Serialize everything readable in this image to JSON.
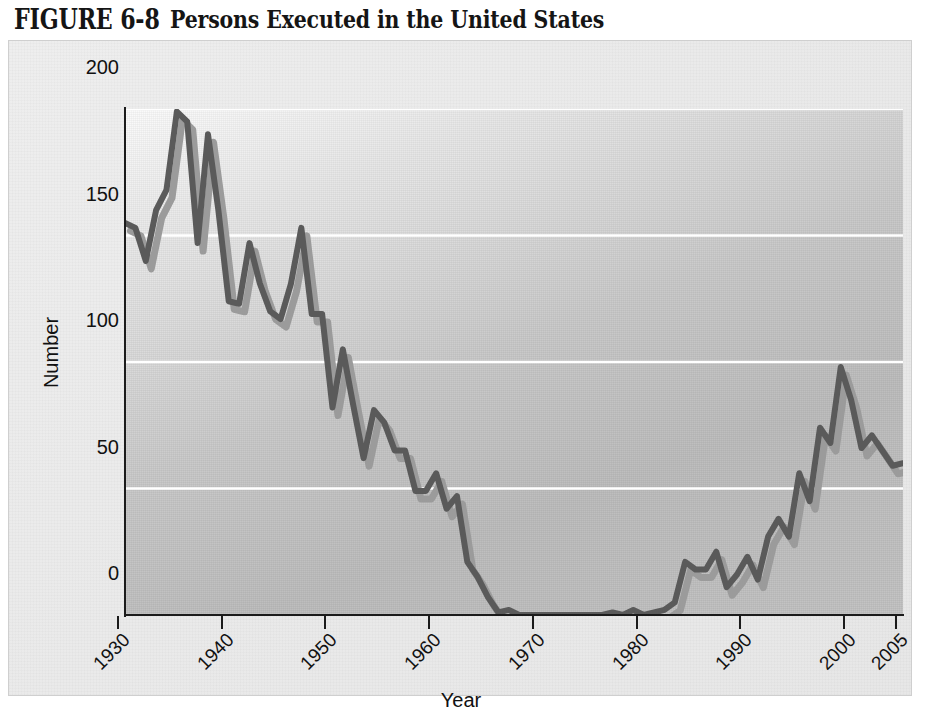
{
  "figure": {
    "label": "FIGURE 6-8",
    "caption": "Persons Executed in the United States"
  },
  "colors": {
    "line_main": "#5a5a5a",
    "line_shadow": "#9b9b9b",
    "gridline": "#ffffff",
    "axis": "#1b1b1b",
    "plot_background": "#c2c2c2",
    "panel_background": "#eaeaea",
    "text": "#111111"
  },
  "axes": {
    "y_title": "Number",
    "x_title": "Year",
    "y_ticks": [
      0,
      50,
      100,
      150,
      200
    ],
    "y_tick_labels": [
      "0",
      "50",
      "100",
      "150",
      "200"
    ],
    "x_ticks": [
      1930,
      1940,
      1950,
      1960,
      1970,
      1980,
      1990,
      2000,
      2005
    ],
    "x_tick_labels": [
      "1930",
      "1940",
      "1950",
      "1960",
      "1970",
      "1980",
      "1990",
      "2000",
      "2005"
    ]
  },
  "chart_data": {
    "type": "line",
    "title": "Persons Executed in the United States",
    "xlabel": "Year",
    "ylabel": "Number",
    "xlim": [
      1930,
      2005
    ],
    "ylim": [
      0,
      200
    ],
    "grid": "horizontal",
    "legend": "none",
    "series": [
      {
        "name": "Persons executed",
        "x": [
          1930,
          1931,
          1932,
          1933,
          1934,
          1935,
          1936,
          1937,
          1938,
          1939,
          1940,
          1941,
          1942,
          1943,
          1944,
          1945,
          1946,
          1947,
          1948,
          1949,
          1950,
          1951,
          1952,
          1953,
          1954,
          1955,
          1956,
          1957,
          1958,
          1959,
          1960,
          1961,
          1962,
          1963,
          1964,
          1965,
          1966,
          1967,
          1968,
          1969,
          1970,
          1971,
          1972,
          1973,
          1974,
          1975,
          1976,
          1977,
          1978,
          1979,
          1980,
          1981,
          1982,
          1983,
          1984,
          1985,
          1986,
          1987,
          1988,
          1989,
          1990,
          1991,
          1992,
          1993,
          1994,
          1995,
          1996,
          1997,
          1998,
          1999,
          2000,
          2001,
          2002,
          2003,
          2004,
          2005
        ],
        "values": [
          155,
          153,
          140,
          160,
          168,
          199,
          195,
          147,
          190,
          160,
          124,
          123,
          147,
          131,
          120,
          117,
          131,
          153,
          119,
          119,
          82,
          105,
          83,
          62,
          81,
          76,
          65,
          65,
          49,
          49,
          56,
          42,
          47,
          21,
          15,
          7,
          1,
          2,
          0,
          0,
          0,
          0,
          0,
          0,
          0,
          0,
          0,
          1,
          0,
          2,
          0,
          1,
          2,
          5,
          21,
          18,
          18,
          25,
          11,
          16,
          23,
          14,
          31,
          38,
          31,
          56,
          45,
          74,
          68,
          98,
          85,
          66,
          71,
          65,
          59,
          60
        ]
      }
    ]
  }
}
